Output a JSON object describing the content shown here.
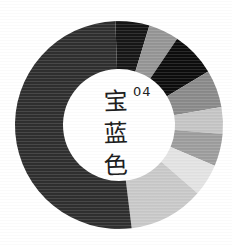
{
  "page": {
    "background_color": "#ffffff"
  },
  "center": {
    "title": "宝蓝色",
    "title_chars": [
      "宝",
      "蓝",
      "色"
    ],
    "number": "04",
    "ink_color": "#1e1e1e"
  },
  "chart_data": {
    "type": "pie",
    "donut": true,
    "legend": "none",
    "data_labels": "none",
    "start_angle_deg": -2,
    "geometry": {
      "cx": 119,
      "cy": 125,
      "outer_radius": 104,
      "inner_radius": 56
    },
    "hole_color": "#ffffff",
    "segments": [
      {
        "name": "black-1",
        "degrees": 19,
        "percent": 5.3,
        "color": "#161616"
      },
      {
        "name": "gray-medium-1",
        "degrees": 17,
        "percent": 4.7,
        "color": "#959595"
      },
      {
        "name": "black-2",
        "degrees": 25,
        "percent": 6.9,
        "color": "#0d0d0d"
      },
      {
        "name": "gray-dark-1",
        "degrees": 21,
        "percent": 5.8,
        "color": "#8a8a8a"
      },
      {
        "name": "gray-light-1",
        "degrees": 15,
        "percent": 4.2,
        "color": "#c5c5c5"
      },
      {
        "name": "gray-medium-2",
        "degrees": 18,
        "percent": 5.0,
        "color": "#9d9d9d"
      },
      {
        "name": "gray-verylight",
        "degrees": 18,
        "percent": 5.0,
        "color": "#e3e3e3"
      },
      {
        "name": "gray-light-2",
        "degrees": 42,
        "percent": 11.7,
        "color": "#c9c9c9"
      },
      {
        "name": "charcoal-main",
        "degrees": 185,
        "percent": 51.4,
        "color": "#2f2f2f"
      }
    ]
  }
}
